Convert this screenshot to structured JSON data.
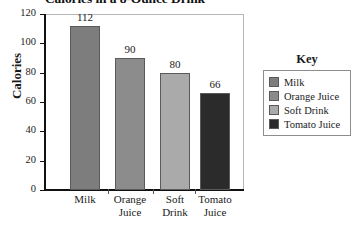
{
  "chart_data": {
    "type": "bar",
    "title": "Calories in a 8-Ounce Drink",
    "xlabel": "",
    "ylabel": "Calories",
    "categories": [
      "Milk",
      "Orange Juice",
      "Soft Drink",
      "Tomato Juice"
    ],
    "category_lines": [
      [
        "Milk"
      ],
      [
        "Orange",
        "Juice"
      ],
      [
        "Soft",
        "Drink"
      ],
      [
        "Tomato",
        "Juice"
      ]
    ],
    "values": [
      112,
      90,
      80,
      66
    ],
    "value_labels": [
      "112",
      "90",
      "80",
      "66"
    ],
    "ylim": [
      0,
      120
    ],
    "yticks": [
      0,
      20,
      40,
      60,
      80,
      100,
      120
    ],
    "ytick_labels": [
      "0",
      "20",
      "40",
      "60",
      "80",
      "100",
      "120"
    ],
    "grid": false,
    "legend_position": "right",
    "bar_colors": [
      "#7d7d7d",
      "#8c8c8c",
      "#aaaaaa",
      "#2b2b2b"
    ]
  },
  "legend": {
    "title": "Key",
    "entries": [
      {
        "label": "Milk",
        "color": "#7d7d7d"
      },
      {
        "label": "Orange Juice",
        "color": "#8c8c8c"
      },
      {
        "label": "Soft Drink",
        "color": "#aaaaaa"
      },
      {
        "label": "Tomato Juice",
        "color": "#2b2b2b"
      }
    ]
  }
}
